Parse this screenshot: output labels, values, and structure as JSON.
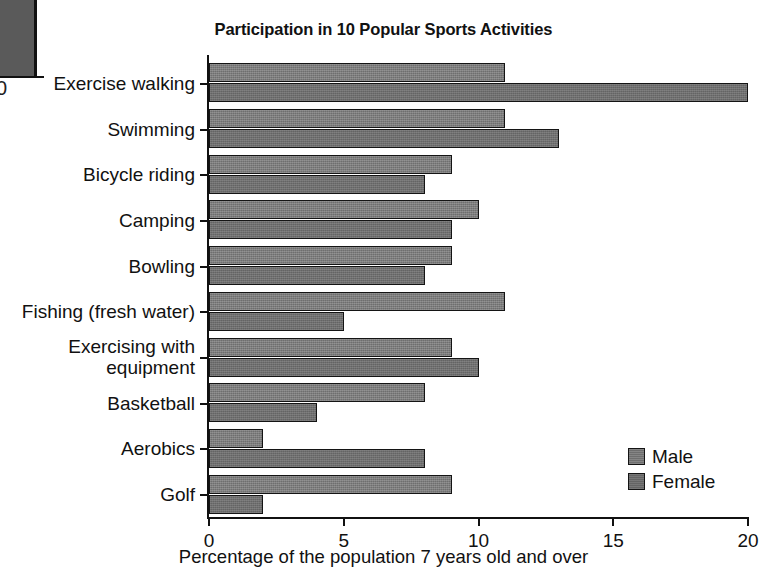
{
  "chart_data": {
    "type": "bar",
    "orientation": "horizontal",
    "title": "Participation in 10 Popular Sports Activities",
    "xlabel": "Percentage of the population 7 years old and over",
    "ylabel": "",
    "xlim": [
      0,
      20
    ],
    "xticks": [
      0,
      5,
      10,
      15,
      20
    ],
    "xtick_labels": [
      "0",
      "5",
      "10",
      "15",
      "20"
    ],
    "grid": false,
    "legend_position": "bottom-right",
    "categories": [
      "Exercise walking",
      "Swimming",
      "Bicycle riding",
      "Camping",
      "Bowling",
      "Fishing (fresh water)",
      "Exercising with\nequipment",
      "Basketball",
      "Aerobics",
      "Golf"
    ],
    "series": [
      {
        "name": "Male",
        "color": "#6e6e6e",
        "values": [
          11,
          11,
          9,
          10,
          9,
          11,
          9,
          8,
          2,
          9
        ]
      },
      {
        "name": "Female",
        "color": "#646464",
        "values": [
          20,
          13,
          8,
          9,
          8,
          5,
          10,
          4,
          8,
          2
        ]
      }
    ]
  },
  "legend": {
    "items": [
      {
        "label": "Male",
        "key": "male"
      },
      {
        "label": "Female",
        "key": "female"
      }
    ]
  },
  "edge_artifact": {
    "tick_label": "0"
  }
}
